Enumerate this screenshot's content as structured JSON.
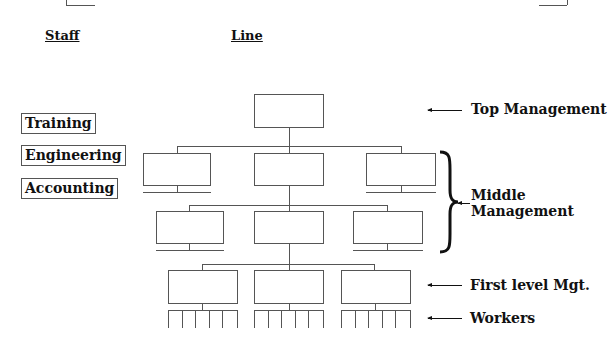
{
  "headings": {
    "staff": "Staff",
    "line": "Line"
  },
  "staff_departments": [
    {
      "label": "Training"
    },
    {
      "label": "Engineering"
    },
    {
      "label": "Accounting"
    }
  ],
  "levels": [
    {
      "label": "Top Management"
    },
    {
      "label": "Middle Management",
      "line1": "Middle",
      "line2": "Management"
    },
    {
      "label": "First level Mgt."
    },
    {
      "label": "Workers"
    }
  ],
  "org_chart": {
    "top_boxes": 1,
    "middle_rows": 2,
    "middle_boxes_per_row": 3,
    "first_level_boxes": 3,
    "workers_per_group": 6
  }
}
